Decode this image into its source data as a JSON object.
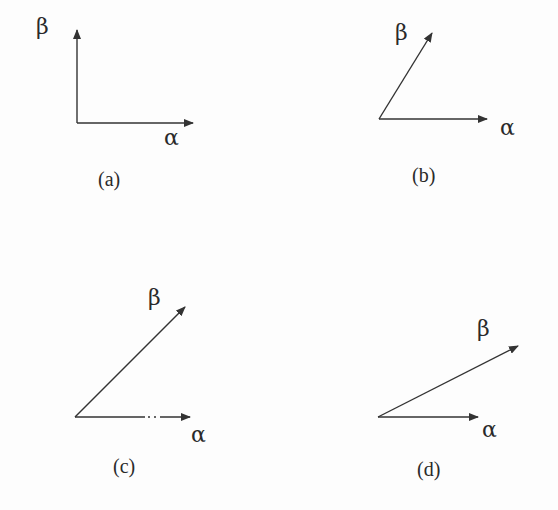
{
  "colors": {
    "background": "#fdfdfd",
    "ink": "#2a2a2a"
  },
  "panels": [
    {
      "caption": "(a)",
      "origin": [
        77,
        123
      ],
      "vectors": [
        {
          "label": "β",
          "tip": [
            77,
            30
          ],
          "label_pos": [
            36,
            34
          ]
        },
        {
          "label": "α",
          "tip": [
            193,
            123
          ],
          "label_pos": [
            164,
            145
          ]
        }
      ],
      "caption_pos": [
        98,
        186
      ]
    },
    {
      "caption": "(b)",
      "origin": [
        379,
        119
      ],
      "vectors": [
        {
          "label": "β",
          "tip": [
            432,
            33
          ],
          "label_pos": [
            395,
            40
          ]
        },
        {
          "label": "α",
          "tip": [
            487,
            119
          ],
          "label_pos": [
            500,
            135
          ]
        }
      ],
      "caption_pos": [
        412,
        182
      ]
    },
    {
      "caption": "(c)",
      "origin": [
        75,
        417
      ],
      "vectors": [
        {
          "label": "β",
          "tip": [
            185,
            307
          ],
          "label_pos": [
            148,
            305
          ]
        },
        {
          "label": "α",
          "tip": [
            190,
            417
          ],
          "label_pos": [
            191,
            442
          ]
        }
      ],
      "caption_pos": [
        113,
        473
      ]
    },
    {
      "caption": "(d)",
      "origin": [
        378,
        417
      ],
      "vectors": [
        {
          "label": "β",
          "tip": [
            518,
            346
          ],
          "label_pos": [
            477,
            336
          ]
        },
        {
          "label": "α",
          "tip": [
            478,
            417
          ],
          "label_pos": [
            482,
            437
          ]
        }
      ],
      "caption_pos": [
        417,
        476
      ]
    }
  ]
}
